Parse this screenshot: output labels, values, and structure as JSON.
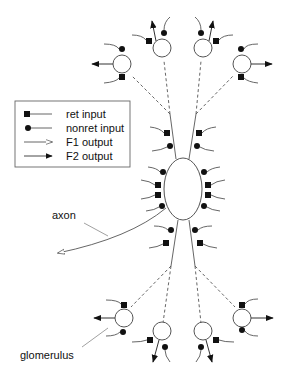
{
  "diagram": {
    "type": "neuron-schematic",
    "legend": {
      "items": [
        {
          "symbol": "filled-square",
          "label": "ret input"
        },
        {
          "symbol": "filled-circle",
          "label": "nonret input"
        },
        {
          "symbol": "open-arrow",
          "label": "F1 output"
        },
        {
          "symbol": "filled-arrow",
          "label": "F2 output"
        }
      ]
    },
    "labels": {
      "axon": "axon",
      "glomerulus": "glomerulus"
    },
    "colors": {
      "stroke": "#555555",
      "fill": "#111111",
      "background": "#ffffff"
    }
  }
}
